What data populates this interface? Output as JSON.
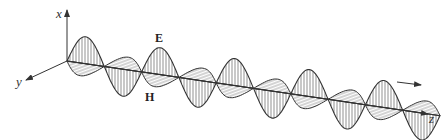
{
  "figure": {
    "axes": {
      "x_label": "x",
      "y_label": "y",
      "z_label": "z"
    },
    "fields": {
      "electric_label": "E",
      "magnetic_label": "H"
    },
    "propagation_arrow": "direction-of-propagation",
    "colors": {
      "stroke": "#333333",
      "background": "#ffffff"
    }
  }
}
